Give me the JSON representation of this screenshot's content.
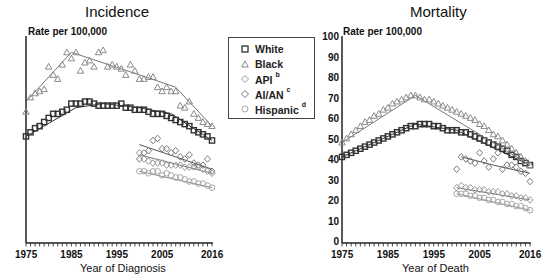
{
  "legend": {
    "items": [
      {
        "label": "White",
        "sup": "",
        "marker": "square",
        "color": "#333333"
      },
      {
        "label": "Black",
        "sup": "",
        "marker": "triangle",
        "color": "#888888"
      },
      {
        "label": "API",
        "sup": "b",
        "marker": "diamond",
        "color": "#999999"
      },
      {
        "label": "AI/AN",
        "sup": "c",
        "marker": "diamond",
        "color": "#777777"
      },
      {
        "label": "Hispanic",
        "sup": "d",
        "marker": "circle",
        "color": "#aaaaaa"
      }
    ]
  },
  "panels": [
    {
      "title": "Incidence",
      "ylabel": "Rate per 100,000",
      "xlabel": "Year of Diagnosis"
    },
    {
      "title": "Mortality",
      "ylabel": "Rate per 100,000",
      "xlabel": "Year of Death"
    }
  ],
  "axis": {
    "yticks": [
      "0",
      "10",
      "20",
      "30",
      "40",
      "50",
      "60",
      "70",
      "80",
      "90",
      "100"
    ],
    "xticks": [
      "1975",
      "1985",
      "1995",
      "2005",
      "2016"
    ]
  },
  "chart_data": [
    {
      "type": "scatter",
      "title": "Incidence",
      "xlabel": "Year of Diagnosis",
      "ylabel": "Rate per 100,000",
      "xlim": [
        1975,
        2016
      ],
      "ylim": [
        0,
        100
      ],
      "grid": false,
      "legend_position": "between panels",
      "series": [
        {
          "name": "White",
          "marker": "square",
          "x_start": 1975,
          "values": [
            52,
            54,
            56,
            57,
            59,
            61,
            63,
            63,
            64,
            65,
            68,
            68,
            68,
            69,
            69,
            68,
            67,
            67,
            67,
            67,
            67,
            68,
            66,
            66,
            65,
            65,
            65,
            64,
            63,
            63,
            63,
            62,
            61,
            60,
            59,
            58,
            57,
            55,
            54,
            53,
            52,
            50
          ],
          "trend": [
            [
              1975,
              52
            ],
            [
              1986,
              66
            ],
            [
              1992,
              68
            ],
            [
              2000,
              66
            ],
            [
              2007,
              63
            ],
            [
              2016,
              50
            ]
          ]
        },
        {
          "name": "Black",
          "marker": "triangle",
          "x_start": 1975,
          "values": [
            64,
            71,
            73,
            74,
            75,
            86,
            82,
            80,
            87,
            93,
            90,
            93,
            84,
            88,
            89,
            86,
            93,
            94,
            86,
            87,
            86,
            85,
            82,
            87,
            84,
            80,
            80,
            81,
            81,
            76,
            74,
            76,
            74,
            74,
            67,
            66,
            69,
            63,
            61,
            59,
            58,
            57
          ],
          "trend": [
            [
              1975,
              69
            ],
            [
              1985,
              93
            ],
            [
              2000,
              82
            ],
            [
              2008,
              76
            ],
            [
              2016,
              57
            ]
          ]
        },
        {
          "name": "API",
          "marker": "diamond",
          "x_start": 2000,
          "values": [
            44,
            41,
            40,
            39,
            39,
            39,
            38,
            38,
            38,
            38,
            37,
            37,
            37,
            37,
            36,
            35,
            34
          ],
          "trend": [
            [
              2000,
              43
            ],
            [
              2016,
              34
            ]
          ]
        },
        {
          "name": "AI/AN",
          "marker": "diamond",
          "x_start": 2000,
          "values": [
            41,
            44,
            45,
            50,
            51,
            46,
            46,
            44,
            45,
            42,
            41,
            43,
            39,
            38,
            38,
            41,
            35
          ],
          "trend": [
            [
              2000,
              48
            ],
            [
              2016,
              36
            ]
          ]
        },
        {
          "name": "Hispanic",
          "marker": "circle",
          "x_start": 2000,
          "values": [
            35,
            35,
            34,
            35,
            35,
            33,
            34,
            33,
            32,
            32,
            31,
            30,
            30,
            29,
            29,
            28,
            27
          ],
          "trend": [
            [
              2000,
              35
            ],
            [
              2016,
              27
            ]
          ]
        }
      ]
    },
    {
      "type": "scatter",
      "title": "Mortality",
      "xlabel": "Year of Death",
      "ylabel": "Rate per 100,000",
      "xlim": [
        1975,
        2016
      ],
      "ylim": [
        0,
        100
      ],
      "grid": false,
      "series": [
        {
          "name": "White",
          "marker": "square",
          "x_start": 1975,
          "values": [
            42,
            43,
            44,
            45,
            46,
            47,
            48,
            49,
            50,
            51,
            52,
            53,
            54,
            55,
            56,
            57,
            57,
            58,
            58,
            58,
            57,
            57,
            56,
            55,
            55,
            55,
            54,
            54,
            53,
            52,
            51,
            50,
            49,
            48,
            47,
            46,
            45,
            43,
            42,
            40,
            39,
            38
          ],
          "trend": [
            [
              1975,
              42
            ],
            [
              1991,
              58
            ],
            [
              2000,
              55
            ],
            [
              2016,
              38
            ]
          ]
        },
        {
          "name": "Black",
          "marker": "triangle",
          "x_start": 1975,
          "values": [
            49,
            51,
            53,
            55,
            57,
            59,
            60,
            62,
            63,
            65,
            66,
            68,
            69,
            70,
            71,
            72,
            72,
            71,
            70,
            70,
            69,
            68,
            67,
            66,
            65,
            64,
            63,
            62,
            61,
            60,
            58,
            57,
            55,
            53,
            52,
            50,
            48,
            46,
            44,
            42,
            40,
            38
          ],
          "trend": [
            [
              1975,
              49
            ],
            [
              1991,
              72
            ],
            [
              2016,
              38
            ]
          ]
        },
        {
          "name": "API",
          "marker": "diamond",
          "x_start": 2000,
          "values": [
            27,
            28,
            27,
            27,
            26,
            26,
            26,
            25,
            25,
            25,
            24,
            24,
            23,
            23,
            22,
            22,
            21
          ],
          "trend": [
            [
              2000,
              27
            ],
            [
              2016,
              21
            ]
          ]
        },
        {
          "name": "AI/AN",
          "marker": "diamond",
          "x_start": 2000,
          "values": [
            36,
            42,
            41,
            40,
            39,
            44,
            40,
            37,
            41,
            44,
            36,
            38,
            38,
            37,
            35,
            34,
            30
          ],
          "trend": [
            [
              2001,
              42
            ],
            [
              2008,
              38
            ],
            [
              2016,
              34
            ]
          ]
        },
        {
          "name": "Hispanic",
          "marker": "circle",
          "x_start": 2000,
          "values": [
            24,
            24,
            24,
            23,
            23,
            22,
            22,
            21,
            21,
            20,
            20,
            19,
            19,
            18,
            18,
            17,
            16
          ],
          "trend": [
            [
              2000,
              24
            ],
            [
              2016,
              16
            ]
          ]
        }
      ]
    }
  ]
}
